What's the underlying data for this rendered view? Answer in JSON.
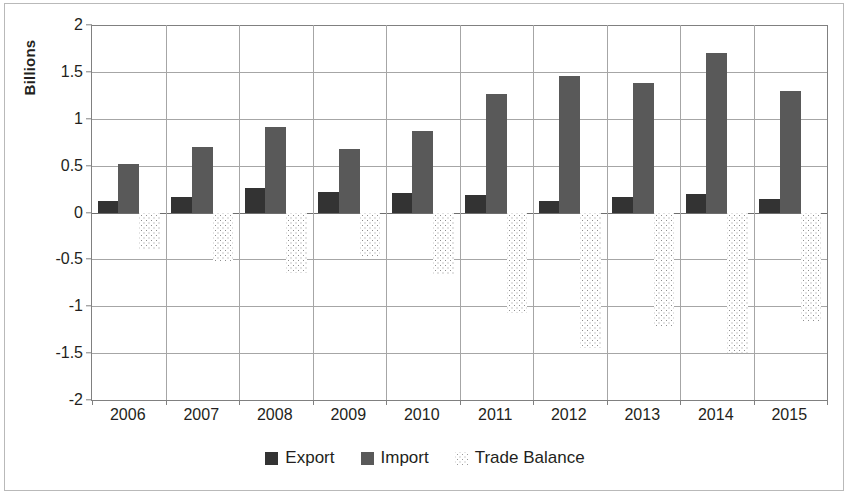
{
  "chart_data": {
    "type": "bar",
    "title": "",
    "subtitle": "",
    "xlabel": "",
    "ylabel": "Billions",
    "ylim": [
      -2,
      2
    ],
    "y_ticks": [
      2,
      1.5,
      1,
      0.5,
      0,
      -0.5,
      -1,
      -1.5,
      -2
    ],
    "y_tick_labels": [
      "2",
      "1.5",
      "1",
      "0.5",
      "0",
      "-0.5",
      "-1",
      "-1.5",
      "-2"
    ],
    "grid": true,
    "legend_position": "bottom",
    "categories": [
      "2006",
      "2007",
      "2008",
      "2009",
      "2010",
      "2011",
      "2012",
      "2013",
      "2014",
      "2015"
    ],
    "series": [
      {
        "name": "Export",
        "color": "#333333",
        "values": [
          0.12,
          0.17,
          0.26,
          0.22,
          0.21,
          0.19,
          0.12,
          0.17,
          0.2,
          0.14
        ]
      },
      {
        "name": "Import",
        "color": "#595959",
        "values": [
          0.52,
          0.7,
          0.91,
          0.68,
          0.87,
          1.26,
          1.46,
          1.38,
          1.7,
          1.3
        ]
      },
      {
        "name": "Trade Balance",
        "color": "#ffffff",
        "pattern": "dotted",
        "values": [
          -0.4,
          -0.53,
          -0.65,
          -0.46,
          -0.66,
          -1.07,
          -1.45,
          -1.22,
          -1.5,
          -1.16
        ]
      }
    ]
  },
  "axis": {
    "y_title": "Billions"
  },
  "legend": {
    "items": [
      {
        "label": "Export",
        "swatch": "export-swatch-icon"
      },
      {
        "label": "Import",
        "swatch": "import-swatch-icon"
      },
      {
        "label": "Trade Balance",
        "swatch": "trade-balance-swatch-icon"
      }
    ]
  }
}
